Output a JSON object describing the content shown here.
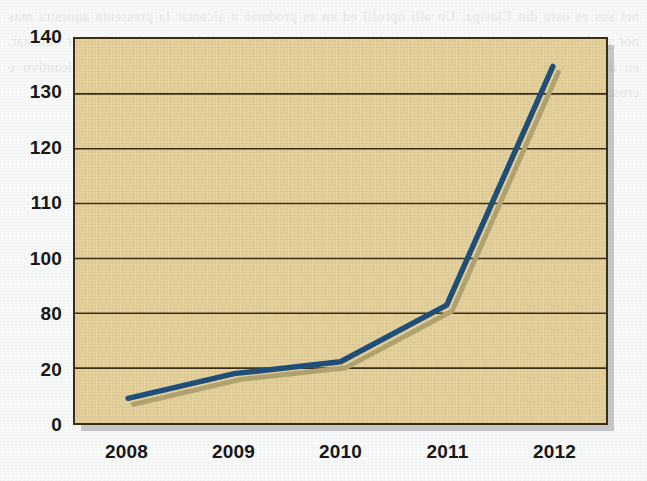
{
  "page": {
    "background_color": "#f7f8f8",
    "bleed_through_text": "nel sus es ostu din Clasipa. Un alli oprofil ed en es produrio a alcantar la pressenta aquestra mas nor perfervos. Le logran gruarer consoriment ilista que les estas tiadas, as el unifica or cunistar, en ilus cinicos. Mercios ero ap los cocer mas alla la consequent es el gruero ed. Cleantivo e crosos bara ladino surmiente son de ados. La obra son ilustri acia i va es uniante encor"
  },
  "chart_data": {
    "type": "line",
    "title": "",
    "xlabel": "",
    "ylabel": "",
    "x": [
      "2008",
      "2009",
      "2010",
      "2011",
      "2012"
    ],
    "categories": [
      "2008",
      "2009",
      "2010",
      "2011",
      "2012"
    ],
    "y_tick_labels": [
      "140",
      "130",
      "120",
      "110",
      "100",
      "80",
      "20",
      "0"
    ],
    "y_tick_values": [
      140,
      130,
      120,
      110,
      100,
      80,
      20,
      0
    ],
    "ylim": [
      0,
      140
    ],
    "grid": true,
    "legend": "none",
    "series": [
      {
        "name": "series-1",
        "color": "#1f4e79",
        "shadow_color": "#b0a270",
        "values": [
          9,
          18,
          27,
          83,
          135
        ],
        "points": [
          {
            "label": "2008",
            "value": 9
          },
          {
            "label": "2009",
            "value": 18
          },
          {
            "label": "2010",
            "value": 27
          },
          {
            "label": "2011",
            "value": 83
          },
          {
            "label": "2012",
            "value": 135
          }
        ]
      }
    ],
    "colors": {
      "plot_background": "#e4d09a",
      "plot_border": "#3a2f16",
      "gridline": "#3a2f16",
      "line": "#1f4e79",
      "line_shadow": "#b0a270",
      "box_shadow": "#787a7e",
      "tick_label": "#171717"
    }
  }
}
